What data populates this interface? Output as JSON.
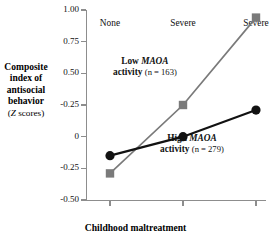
{
  "chart_data": {
    "type": "line",
    "title": "",
    "xlabel": "Childhood maltreatment",
    "ylabel": "Composite index of antisocial behavior (Z scores)",
    "categories": [
      "None",
      "Severe",
      "Severe"
    ],
    "ylim": [
      -0.5,
      1.0
    ],
    "yticks": [
      1.0,
      0.75,
      0.5,
      0.25,
      0.0,
      -0.25,
      -0.5
    ],
    "ytick_labels": [
      "1.00",
      "0.75",
      "0.50",
      "-0.25",
      "0",
      "-0.25",
      "-0.50"
    ],
    "grid": false,
    "legend_position": "inline-annotations",
    "series": [
      {
        "name": "Low MAOA activity",
        "n": 163,
        "marker": "square",
        "color": "#7a7a7a",
        "values": [
          -0.29,
          0.25,
          0.94
        ]
      },
      {
        "name": "High MAOA activity",
        "n": 279,
        "marker": "circle",
        "color": "#121212",
        "values": [
          -0.15,
          0.0,
          0.21
        ]
      }
    ],
    "annotations": [
      {
        "id": "low",
        "line1_prefix": "Low ",
        "line1_gene": "MAOA",
        "line2_prefix": "activity ",
        "line2_n": "(n = 163)"
      },
      {
        "id": "high",
        "line1_prefix": "High ",
        "line1_gene": "MAOA",
        "line2_prefix": "activity ",
        "line2_n": "(n = 279)"
      }
    ]
  },
  "axis_title": {
    "line1": "Composite",
    "line2": "index of",
    "line3": "antisocial",
    "line4": "behavior",
    "line5_open": "(",
    "line5_italic": "Z",
    "line5_rest": " scores)"
  },
  "colors": {
    "low_maoa": "#7a7a7a",
    "high_maoa": "#121212",
    "axis": "#8d8d8d",
    "background": "#ffffff"
  }
}
